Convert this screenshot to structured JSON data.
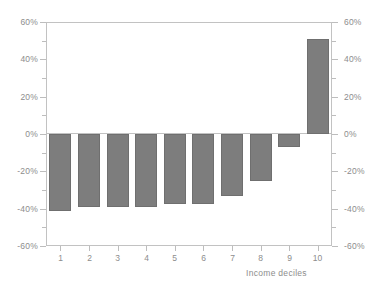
{
  "chart_data": {
    "type": "bar",
    "title": "",
    "subtitle": "",
    "xlabel": "Income deciles",
    "ylabel": "",
    "categories": [
      "1",
      "2",
      "3",
      "4",
      "5",
      "6",
      "7",
      "8",
      "9",
      "10"
    ],
    "values": [
      -41,
      -39,
      -39,
      -39,
      -37.5,
      -37.5,
      -33,
      -25,
      -7,
      51
    ],
    "series": [
      {
        "name": "",
        "values": [
          -41,
          -39,
          -39,
          -39,
          -37.5,
          -37.5,
          -33,
          -25,
          -7,
          51
        ]
      }
    ],
    "ylim": [
      -60,
      60
    ],
    "ytick_values": [
      60,
      40,
      20,
      0,
      -20,
      -40,
      -60
    ],
    "ytick_labels_left": [
      "60%",
      "40%",
      "20%",
      "0%",
      "-20%",
      "-40%",
      "-60%"
    ],
    "ytick_labels_right": [
      "60%",
      "40%",
      "20%",
      "0%",
      "-20%",
      "-40%",
      "-60%"
    ],
    "yminor_values": [
      50,
      30,
      10,
      -10,
      -30,
      -50
    ],
    "grid": false,
    "legend": null,
    "legend_position": "none",
    "dual_axis": true,
    "bar_color": "#7d7d7d",
    "axis_color": "#c2c2c2",
    "text_color": "#8d8d8d",
    "background": "#ffffff",
    "zero_line": 0,
    "annotations": []
  }
}
